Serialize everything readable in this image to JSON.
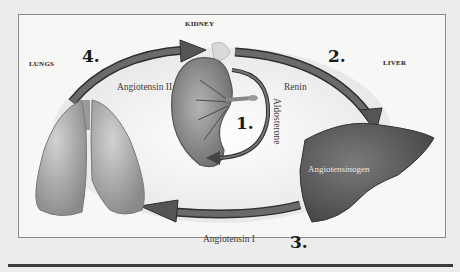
{
  "diagram": {
    "organs": {
      "kidney": "KIDNEY",
      "lungs": "LUNGS",
      "liver": "LIVER"
    },
    "steps": {
      "one": "1.",
      "two": "2.",
      "three": "3.",
      "four": "4."
    },
    "hormones": {
      "angiotensin_ii": "Angiotensin II",
      "renin": "Renin",
      "aldosterone": "Aldosterone",
      "angiotensinogen": "Angiotensinogen",
      "angiotensin_i": "Angiotensin I"
    },
    "flow": [
      {
        "from": "kidney",
        "to": "kidney",
        "label": "Aldosterone",
        "step": "1."
      },
      {
        "from": "kidney",
        "to": "liver",
        "label": "Renin",
        "step": "2."
      },
      {
        "from": "liver",
        "to": "lungs",
        "label": "Angiotensin I",
        "step": "3."
      },
      {
        "from": "lungs",
        "to": "kidney",
        "label": "Angiotensin II",
        "step": "4."
      }
    ],
    "colors": {
      "arrow": "#5a5a5a",
      "arrow_edge": "#2e2e2e",
      "liver": "#5c5c5c",
      "lungs": "#a9a9a9",
      "kidney": "#8c8c8c",
      "frame_border": "#8a8a8a",
      "background": "#ececec"
    }
  }
}
